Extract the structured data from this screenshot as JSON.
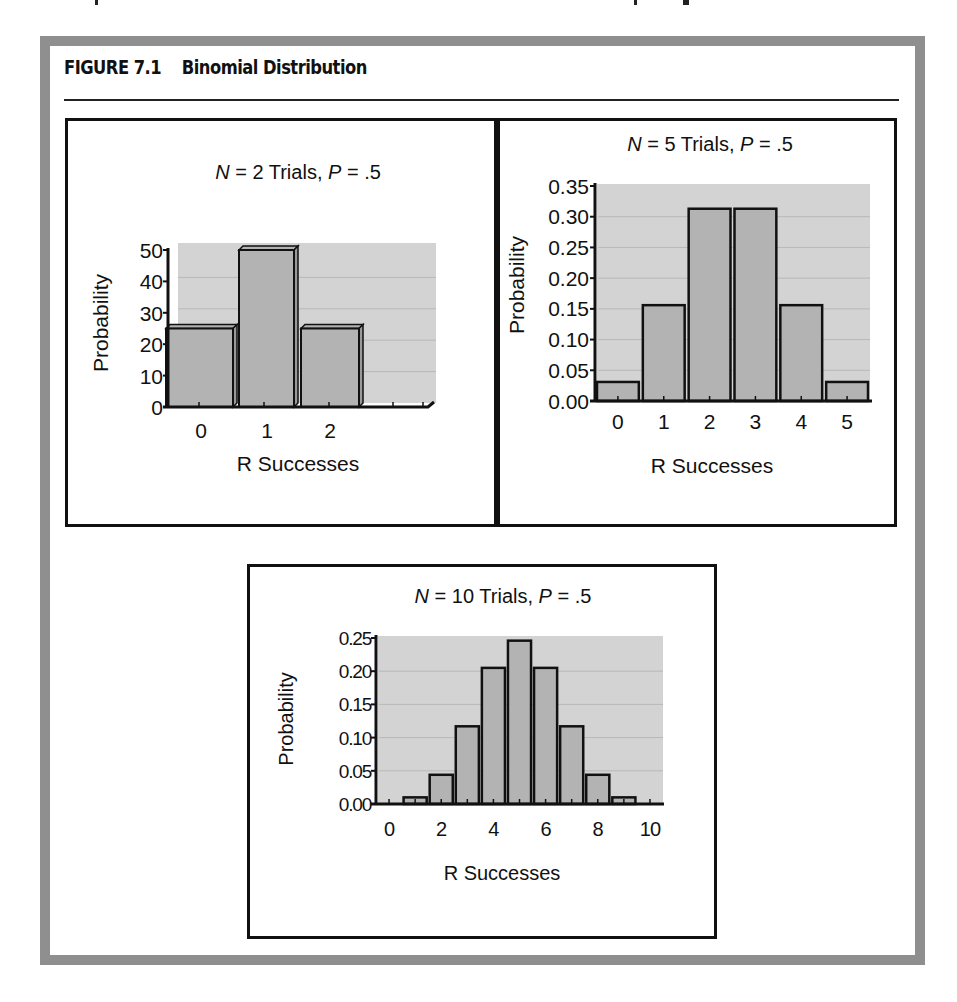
{
  "figure": {
    "number": "FIGURE 7.1",
    "title": "Binomial Distribution"
  },
  "colors": {
    "frame": "#8f8f8f",
    "plot_background": "#d3d3d3",
    "bar_fill": "#b3b3b3",
    "bar_side": "#9a9a9a",
    "outline": "#111111",
    "gridline": "#b8b8b8"
  },
  "chart_data": [
    {
      "type": "bar",
      "style": "3d-column",
      "title_parts": {
        "n_symbol": "N",
        "n_text": " = 2 Trials, ",
        "p_symbol": "P",
        "p_text": " = .5"
      },
      "title": "N = 2 Trials, P = .5",
      "xlabel": "R Successes",
      "ylabel": "Probability",
      "categories": [
        "0",
        "1",
        "2"
      ],
      "values": [
        25,
        50,
        25
      ],
      "yticks": [
        "0",
        "10",
        "20",
        "30",
        "40",
        "50"
      ],
      "ylim": [
        0,
        50
      ],
      "grid": true,
      "legend": "none"
    },
    {
      "type": "bar",
      "title_parts": {
        "n_symbol": "N",
        "n_text": " = 5 Trials, ",
        "p_symbol": "P",
        "p_text": " = .5"
      },
      "title": "N = 5 Trials, P = .5",
      "xlabel": "R Successes",
      "ylabel": "Probability",
      "categories": [
        "0",
        "1",
        "2",
        "3",
        "4",
        "5"
      ],
      "values": [
        0.031,
        0.156,
        0.313,
        0.313,
        0.156,
        0.031
      ],
      "yticks": [
        "0.00",
        "0.05",
        "0.10",
        "0.15",
        "0.20",
        "0.25",
        "0.30",
        "0.35"
      ],
      "ylim": [
        0,
        0.35
      ],
      "grid": true,
      "legend": "none"
    },
    {
      "type": "bar",
      "title_parts": {
        "n_symbol": "N",
        "n_text": " = 10 Trials, ",
        "p_symbol": "P",
        "p_text": " = .5"
      },
      "title": "N = 10 Trials, P = .5",
      "xlabel": "R Successes",
      "ylabel": "Probability",
      "categories": [
        "0",
        "1",
        "2",
        "3",
        "4",
        "5",
        "6",
        "7",
        "8",
        "9",
        "10"
      ],
      "values": [
        0.001,
        0.01,
        0.044,
        0.117,
        0.205,
        0.246,
        0.205,
        0.117,
        0.044,
        0.01,
        0.001
      ],
      "xticks": [
        "0",
        "2",
        "4",
        "6",
        "8",
        "10"
      ],
      "yticks": [
        "0.00",
        "0.05",
        "0.10",
        "0.15",
        "0.20",
        "0.25"
      ],
      "ylim": [
        0,
        0.25
      ],
      "grid": true,
      "legend": "none"
    }
  ]
}
